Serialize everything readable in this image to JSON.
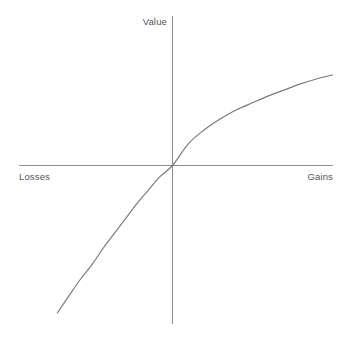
{
  "chart_data": {
    "type": "line",
    "title": "",
    "subtitle": "",
    "xlabel": "",
    "ylabel": "",
    "axis_labels": {
      "y_axis_top": "Value",
      "x_axis_left": "Losses",
      "x_axis_right": "Gains"
    },
    "grid": false,
    "legend": null,
    "annotations": [],
    "xlim": [
      -100,
      100
    ],
    "ylim": [
      -100,
      100
    ],
    "origin": {
      "x": 0,
      "y": 0
    },
    "series": [
      {
        "name": "value function",
        "color": "#797979",
        "description": "S-shaped prospect theory value function: concave for gains, convex and steeper for losses",
        "x": [
          -72,
          -65,
          -58,
          -50,
          -43,
          -36,
          -29,
          -22,
          -15,
          -8,
          0,
          10,
          20,
          30,
          40,
          50,
          60,
          70,
          80,
          90,
          100
        ],
        "y": [
          -90,
          -80,
          -70,
          -60,
          -50,
          -41,
          -32,
          -23,
          -15,
          -7,
          0,
          22,
          36,
          47,
          56,
          63,
          70,
          76,
          82,
          87,
          91
        ]
      }
    ],
    "axes": {
      "x_axis": {
        "from": -100,
        "to": 100,
        "color": "#8c8c8c"
      },
      "y_axis": {
        "from": -100,
        "to": 100,
        "color": "#8c8c8c"
      }
    }
  },
  "colors": {
    "background": "#ffffff",
    "axis": "#8c8c8c",
    "curve": "#797979",
    "label_text": "#555555"
  }
}
